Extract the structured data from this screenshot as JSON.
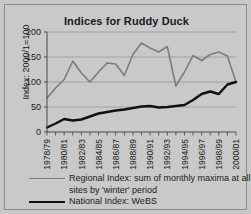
{
  "chart_data": {
    "type": "line",
    "title": "Indices for Ruddy Duck",
    "xlabel": "",
    "ylabel": "Index: 2000/1=100",
    "ylim": [
      0,
      200
    ],
    "yticks": [
      0,
      50,
      100,
      150,
      200
    ],
    "grid": true,
    "legend_position": "bottom",
    "categories": [
      "1978/79",
      "1979/80",
      "1980/81",
      "1981/82",
      "1982/83",
      "1983/84",
      "1984/85",
      "1985/86",
      "1986/87",
      "1987/88",
      "1988/89",
      "1989/90",
      "1990/91",
      "1991/92",
      "1992/93",
      "1993/94",
      "1994/95",
      "1995/96",
      "1996/97",
      "1997/98",
      "1998/99",
      "1999/00",
      "2000/01"
    ],
    "xtick_labels": [
      "1978/79",
      "1980/81",
      "1982/83",
      "1984/85",
      "1986/87",
      "1988/89",
      "1990/91",
      "1992/93",
      "1994/95",
      "1996/97",
      "1998/99",
      "2000/01"
    ],
    "series": [
      {
        "name": "Regional Index: sum of monthly maxima at all sites by 'winter' period",
        "color": "#7d7d7d",
        "width": 1.6,
        "values": [
          68,
          88,
          105,
          142,
          118,
          100,
          120,
          138,
          136,
          113,
          155,
          178,
          168,
          160,
          171,
          92,
          120,
          153,
          143,
          155,
          160,
          152,
          100
        ]
      },
      {
        "name": "National Index: WeBS",
        "color": "#101010",
        "width": 2.4,
        "values": [
          9,
          17,
          26,
          23,
          25,
          31,
          37,
          40,
          43,
          45,
          48,
          51,
          52,
          49,
          50,
          52,
          54,
          64,
          76,
          81,
          76,
          95,
          100
        ]
      }
    ]
  },
  "legend": {
    "regional_line1": "Regional Index: sum of monthly maxima at all",
    "regional_line2": "sites by 'winter' period",
    "national": "National Index: WeBS"
  }
}
